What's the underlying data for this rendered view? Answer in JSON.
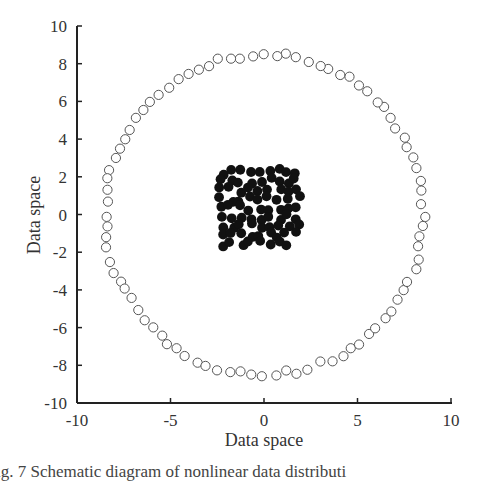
{
  "chart_data": {
    "type": "scatter",
    "title": "",
    "xlabel": "Data space",
    "ylabel": "Data space",
    "xlim": [
      -10,
      10
    ],
    "ylim": [
      -10,
      10
    ],
    "x_ticks": [
      -10,
      -5,
      0,
      5,
      10
    ],
    "y_ticks": [
      -10,
      -8,
      -6,
      -4,
      -2,
      0,
      2,
      4,
      6,
      8,
      10
    ],
    "x_tick_labels": [
      "-10",
      "-5",
      "0",
      "5",
      "10"
    ],
    "y_tick_labels": [
      "-10",
      "-8",
      "-6",
      "-4",
      "-2",
      "0",
      "2",
      "4",
      "6",
      "8",
      "10"
    ],
    "grid": false,
    "legend": null,
    "series": [
      {
        "name": "outer ring (hollow circles)",
        "marker": "open-circle",
        "color": "#555555",
        "description": "Approximately 88 hollow circles arranged on a ring of radius ~8.5 centered at the origin",
        "radius": 8.5,
        "count": 88,
        "center": [
          0,
          0
        ]
      },
      {
        "name": "central cluster (filled circles)",
        "marker": "filled-circle",
        "color": "#111111",
        "description": "Approximately 80 filled black circles densely packed in a square region",
        "x_range": [
          -2.5,
          2.0
        ],
        "y_range": [
          -1.8,
          2.5
        ],
        "count": 80
      }
    ]
  },
  "caption": "ig. 7   Schematic diagram of nonlinear data distributi"
}
